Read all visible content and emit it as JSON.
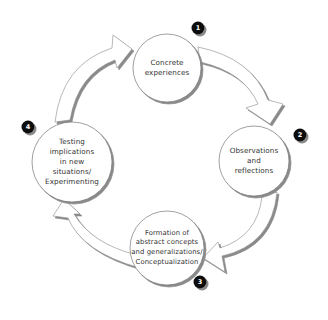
{
  "diagram": {
    "type": "cycle",
    "direction": "clockwise",
    "colors": {
      "background": "#ffffff",
      "node_fill": "#ffffff",
      "node_stroke": "#777777",
      "shadow": "#8a8a8a",
      "badge_fill": "#111111",
      "badge_text": "#ffffff",
      "text": "#333333"
    },
    "nodes": [
      {
        "step": "1",
        "label": "Concrete\nexperiences"
      },
      {
        "step": "2",
        "label": "Observations\nand\nreflections"
      },
      {
        "step": "3",
        "label": "Formation of\nabstract concepts\nand generalizations/\nConceptualization"
      },
      {
        "step": "4",
        "label": "Testing\nimplications\nin new\nsituations/\nExperimenting"
      }
    ],
    "arrows": [
      {
        "from": "1",
        "to": "2"
      },
      {
        "from": "2",
        "to": "3"
      },
      {
        "from": "3",
        "to": "4"
      },
      {
        "from": "4",
        "to": "1"
      }
    ]
  }
}
